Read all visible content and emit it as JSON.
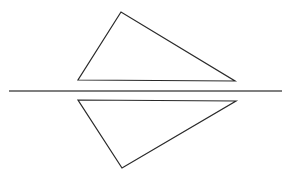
{
  "diagram": {
    "type": "reflection",
    "stroke_color": "#2a2a2a",
    "axis_color": "#555555",
    "background": "#ffffff",
    "axis": {
      "x1": 9,
      "y1": 91,
      "x2": 282,
      "y2": 91
    },
    "original_triangle": {
      "points": [
        [
          121,
          12
        ],
        [
          78,
          80
        ],
        [
          235,
          81
        ]
      ]
    },
    "reflected_triangle": {
      "points": [
        [
          78,
          100
        ],
        [
          236,
          101
        ],
        [
          122,
          168
        ]
      ]
    }
  }
}
